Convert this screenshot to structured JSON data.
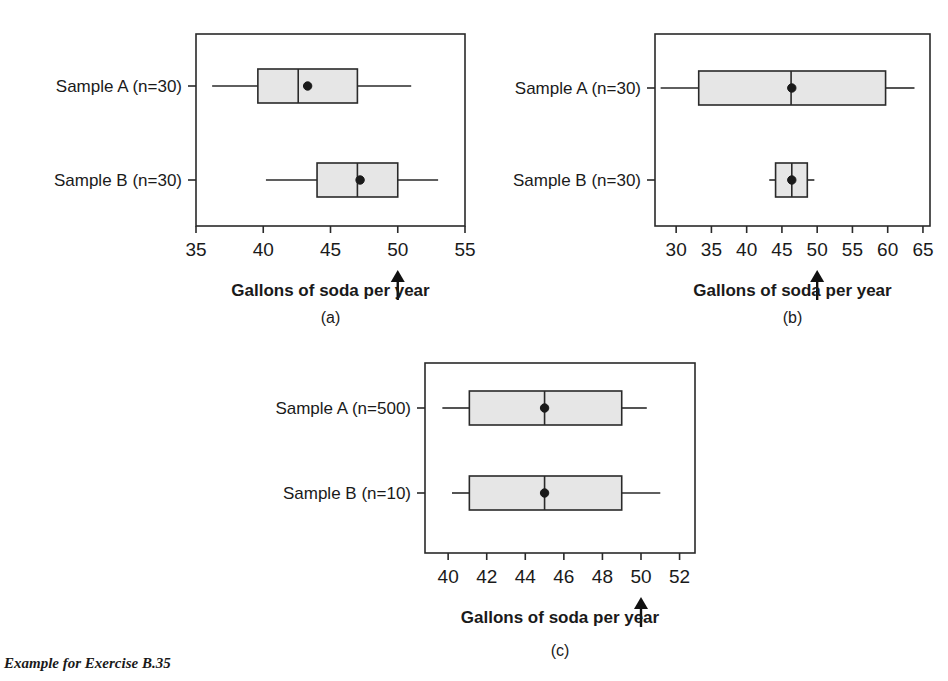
{
  "figure": {
    "caption": "Example for Exercise B.35",
    "axis_title": "Gallons of soda per year",
    "arrow_marker_value": 50
  },
  "chart_data": [
    {
      "type": "box",
      "panel": "(a)",
      "title": "",
      "xlabel": "Gallons of soda per year",
      "ylabel": "",
      "xlim": [
        35,
        55
      ],
      "xticks": [
        35,
        40,
        45,
        50,
        55
      ],
      "xtick_labels": [
        "35",
        "40",
        "45",
        "50",
        "55"
      ],
      "grid": false,
      "annotations": [
        {
          "type": "arrow",
          "x": 50,
          "label": ""
        }
      ],
      "categories": [
        "Sample A (n=30)",
        "Sample B (n=30)"
      ],
      "boxes": [
        {
          "name": "Sample A (n=30)",
          "whisker_low": 36.2,
          "q1": 39.6,
          "median": 42.6,
          "q3": 47.0,
          "whisker_high": 51.0,
          "mean": 43.3
        },
        {
          "name": "Sample B (n=30)",
          "whisker_low": 40.2,
          "q1": 44.0,
          "median": 47.0,
          "q3": 50.0,
          "whisker_high": 53.0,
          "mean": 47.2
        }
      ]
    },
    {
      "type": "box",
      "panel": "(b)",
      "title": "",
      "xlabel": "Gallons of soda per year",
      "ylabel": "",
      "xlim": [
        27,
        66
      ],
      "xticks": [
        30,
        35,
        40,
        45,
        50,
        55,
        60,
        65
      ],
      "xtick_labels": [
        "30",
        "35",
        "40",
        "45",
        "50",
        "55",
        "60",
        "65"
      ],
      "grid": false,
      "annotations": [
        {
          "type": "arrow",
          "x": 50,
          "label": ""
        }
      ],
      "categories": [
        "Sample A (n=30)",
        "Sample B (n=30)"
      ],
      "boxes": [
        {
          "name": "Sample A (n=30)",
          "whisker_low": 27.8,
          "q1": 33.2,
          "median": 46.3,
          "q3": 59.7,
          "whisker_high": 63.8,
          "mean": 46.4
        },
        {
          "name": "Sample B (n=30)",
          "whisker_low": 43.2,
          "q1": 44.1,
          "median": 46.4,
          "q3": 48.6,
          "whisker_high": 49.6,
          "mean": 46.4
        }
      ]
    },
    {
      "type": "box",
      "panel": "(c)",
      "title": "",
      "xlabel": "Gallons of soda per year",
      "ylabel": "",
      "xlim": [
        38.8,
        52.8
      ],
      "xticks": [
        40,
        42,
        44,
        46,
        48,
        50,
        52
      ],
      "xtick_labels": [
        "40",
        "42",
        "44",
        "46",
        "48",
        "50",
        "52"
      ],
      "grid": false,
      "annotations": [
        {
          "type": "arrow",
          "x": 50,
          "label": ""
        }
      ],
      "categories": [
        "Sample A (n=500)",
        "Sample B (n=10)"
      ],
      "boxes": [
        {
          "name": "Sample A (n=500)",
          "whisker_low": 39.7,
          "q1": 41.1,
          "median": 45.0,
          "q3": 49.0,
          "whisker_high": 50.3,
          "mean": 45.0
        },
        {
          "name": "Sample B (n=10)",
          "whisker_low": 40.2,
          "q1": 41.1,
          "median": 45.0,
          "q3": 49.0,
          "whisker_high": 51.0,
          "mean": 45.0
        }
      ]
    }
  ],
  "style": {
    "box_fill": "#e6e6e6",
    "line_color": "#2a2a2a",
    "text_color": "#1a1a1a"
  }
}
